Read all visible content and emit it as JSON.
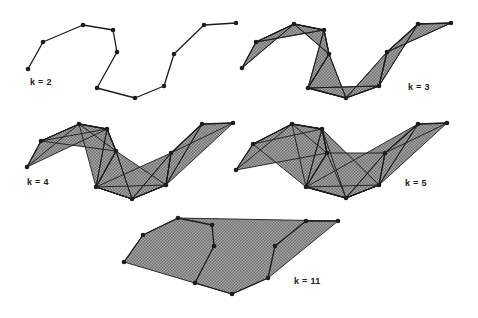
{
  "colors": {
    "fill": "#8f8f8f",
    "stroke": "#1c1c1c",
    "point": "#1c1c1c",
    "background": "#ffffff"
  },
  "panels": [
    {
      "label": "k = 2",
      "label_pos": [
        30,
        82
      ],
      "k": 2,
      "points": [
        [
          28,
          69
        ],
        [
          43,
          42
        ],
        [
          83,
          25
        ],
        [
          113,
          30
        ],
        [
          117,
          52
        ],
        [
          97,
          88
        ],
        [
          135,
          98
        ],
        [
          164,
          86
        ],
        [
          174,
          54
        ],
        [
          204,
          25
        ],
        [
          236,
          23
        ]
      ]
    },
    {
      "label": "k = 3",
      "label_pos": [
        408,
        87
      ],
      "k": 3,
      "points": [
        [
          242,
          68
        ],
        [
          256,
          42
        ],
        [
          294,
          24
        ],
        [
          324,
          30
        ],
        [
          329,
          54
        ],
        [
          308,
          88
        ],
        [
          346,
          98
        ],
        [
          379,
          86
        ],
        [
          387,
          52
        ],
        [
          418,
          24
        ],
        [
          451,
          23
        ]
      ]
    },
    {
      "label": "k = 4",
      "label_pos": [
        27,
        182
      ],
      "k": 4,
      "points": [
        [
          27,
          167
        ],
        [
          41,
          141
        ],
        [
          79,
          124
        ],
        [
          107,
          129
        ],
        [
          116,
          151
        ],
        [
          96,
          187
        ],
        [
          132,
          199
        ],
        [
          166,
          185
        ],
        [
          171,
          153
        ],
        [
          202,
          124
        ],
        [
          233,
          123
        ]
      ]
    },
    {
      "label": "k = 5",
      "label_pos": [
        405,
        183
      ],
      "k": 5,
      "points": [
        [
          236,
          170
        ],
        [
          253,
          144
        ],
        [
          292,
          124
        ],
        [
          322,
          129
        ],
        [
          327,
          153
        ],
        [
          306,
          187
        ],
        [
          346,
          198
        ],
        [
          379,
          185
        ],
        [
          385,
          153
        ],
        [
          418,
          124
        ],
        [
          447,
          123
        ]
      ]
    },
    {
      "label": "k = 11",
      "label_pos": [
        294,
        281
      ],
      "k": 11,
      "points": [
        [
          124,
          262
        ],
        [
          143,
          235
        ],
        [
          178,
          218
        ],
        [
          212,
          225
        ],
        [
          214,
          246
        ],
        [
          195,
          283
        ],
        [
          232,
          294
        ],
        [
          268,
          278
        ],
        [
          275,
          246
        ],
        [
          306,
          221
        ],
        [
          338,
          221
        ]
      ]
    }
  ]
}
